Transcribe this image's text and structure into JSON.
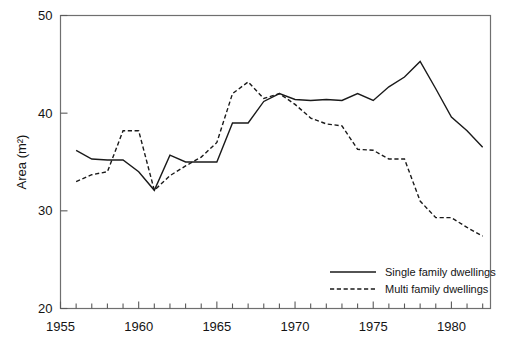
{
  "chart_data": {
    "type": "line",
    "title": "",
    "xlabel": "",
    "ylabel": "Area (m2)",
    "ylabel_display": "Area (m²)",
    "xlim": [
      1955,
      1982.5
    ],
    "ylim": [
      20,
      50
    ],
    "x_ticks_major": [
      1955,
      1960,
      1965,
      1970,
      1975,
      1980
    ],
    "x_tick_labels": [
      "1955",
      "1960",
      "1965",
      "1970",
      "1975",
      "1980"
    ],
    "x_ticks_minor_step": 1,
    "y_ticks": [
      20,
      30,
      40,
      50
    ],
    "y_tick_labels": [
      "20",
      "30",
      "40",
      "50"
    ],
    "grid": false,
    "legend_position": "bottom-right",
    "x": [
      1956,
      1957,
      1958,
      1959,
      1960,
      1961,
      1962,
      1963,
      1964,
      1965,
      1966,
      1967,
      1968,
      1969,
      1970,
      1971,
      1972,
      1973,
      1974,
      1975,
      1976,
      1977,
      1978,
      1979,
      1980,
      1981,
      1982
    ],
    "series": [
      {
        "name": "Single family dwellings",
        "style": "solid",
        "values": [
          36.2,
          35.3,
          35.2,
          35.2,
          34.0,
          32.1,
          35.7,
          35.0,
          35.0,
          35.0,
          39.0,
          39.0,
          41.2,
          42.0,
          41.4,
          41.3,
          41.4,
          41.3,
          42.0,
          41.3,
          42.7,
          43.7,
          45.3,
          42.5,
          39.6,
          38.2,
          36.5
        ]
      },
      {
        "name": "Multi family dwellings",
        "style": "dashed",
        "values": [
          33.0,
          33.7,
          34.0,
          38.2,
          38.2,
          32.1,
          33.6,
          34.6,
          35.5,
          37.0,
          42.0,
          43.2,
          41.5,
          42.0,
          40.9,
          39.5,
          38.9,
          38.7,
          36.3,
          36.2,
          35.3,
          35.3,
          31.0,
          29.3,
          29.3,
          28.3,
          27.4
        ]
      }
    ]
  },
  "legend": {
    "entries": [
      {
        "label": "Single family dwellings",
        "style": "solid"
      },
      {
        "label": "Multi family dwellings",
        "style": "dashed"
      }
    ]
  },
  "axes": {
    "y_title": "Area (m²)"
  }
}
